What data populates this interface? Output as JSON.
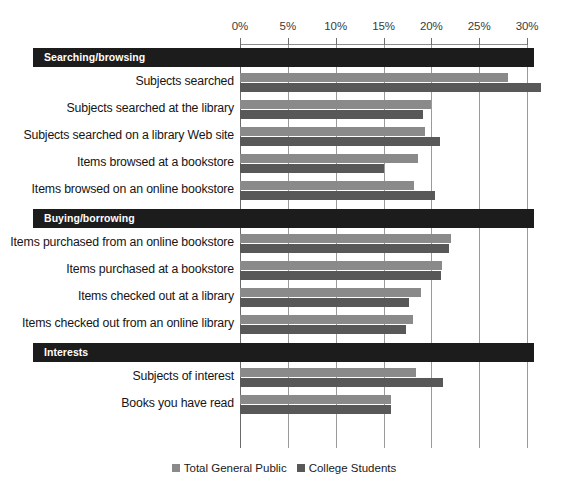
{
  "chart_data": {
    "type": "bar",
    "orientation": "horizontal",
    "title": "",
    "xlabel": "",
    "ylabel": "",
    "xlim": [
      0,
      30
    ],
    "xticks": [
      "0%",
      "5%",
      "10%",
      "15%",
      "20%",
      "25%",
      "30%"
    ],
    "xtick_values": [
      0,
      5,
      10,
      15,
      20,
      25,
      30
    ],
    "grid": true,
    "legend_position": "bottom",
    "series": [
      {
        "name": "Total General Public",
        "color": "#8a8a8a"
      },
      {
        "name": "College Students",
        "color": "#585858"
      }
    ],
    "sections": [
      {
        "header": "Searching/browsing",
        "rows": [
          {
            "label": "Subjects searched",
            "values": [
              28.0,
              31.5
            ]
          },
          {
            "label": "Subjects searched at the library",
            "values": [
              20.0,
              19.1
            ]
          },
          {
            "label": "Subjects searched on a library Web site",
            "values": [
              19.3,
              20.9
            ]
          },
          {
            "label": "Items browsed at a bookstore",
            "values": [
              18.6,
              15.0
            ]
          },
          {
            "label": "Items browsed on an online bookstore",
            "values": [
              18.2,
              20.4
            ]
          }
        ]
      },
      {
        "header": "Buying/borrowing",
        "rows": [
          {
            "label": "Items purchased from an online bookstore",
            "values": [
              22.1,
              21.8
            ]
          },
          {
            "label": "Items purchased at a bookstore",
            "values": [
              21.1,
              21.0
            ]
          },
          {
            "label": "Items checked out at a library",
            "values": [
              18.9,
              17.7
            ]
          },
          {
            "label": "Items checked out from an online library",
            "values": [
              18.1,
              17.4
            ]
          }
        ]
      },
      {
        "header": "Interests",
        "rows": [
          {
            "label": "Subjects of interest",
            "values": [
              18.4,
              21.2
            ]
          },
          {
            "label": "Books you have read",
            "values": [
              15.8,
              15.8
            ]
          }
        ]
      }
    ]
  },
  "legend": {
    "items": [
      {
        "label": "Total General Public",
        "color": "#8a8a8a"
      },
      {
        "label": "College Students",
        "color": "#585858"
      }
    ]
  }
}
